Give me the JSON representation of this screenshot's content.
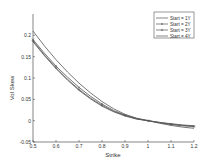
{
  "chart_data": {
    "type": "line",
    "title": "",
    "xlabel": "Strike",
    "ylabel": "Vol Skew",
    "xlim": [
      0.5,
      1.2
    ],
    "ylim": [
      -0.05,
      0.25
    ],
    "xticks": [
      "0.5",
      "0.6",
      "0.7",
      "0.8",
      "0.9",
      "1",
      "1.1",
      "1.2"
    ],
    "yticks": [
      "-0.05",
      "0",
      "0.05",
      "0.1",
      "0.15",
      "0.2"
    ],
    "grid": false,
    "legend_position": "upper right",
    "x": [
      0.5,
      0.55,
      0.6,
      0.65,
      0.7,
      0.75,
      0.8,
      0.85,
      0.9,
      0.95,
      1.0,
      1.05,
      1.1,
      1.15,
      1.2
    ],
    "series": [
      {
        "name": "Start = 1Y",
        "marker": "none",
        "values": [
          0.21,
          0.175,
          0.143,
          0.114,
          0.088,
          0.065,
          0.045,
          0.028,
          0.015,
          0.006,
          0.0,
          -0.006,
          -0.011,
          -0.015,
          -0.018
        ]
      },
      {
        "name": "Start = 2Y",
        "marker": "x",
        "values": [
          0.19,
          0.158,
          0.128,
          0.102,
          0.078,
          0.057,
          0.039,
          0.024,
          0.013,
          0.005,
          0.0,
          -0.005,
          -0.009,
          -0.012,
          -0.014
        ]
      },
      {
        "name": "Start = 3Y",
        "marker": "+",
        "values": [
          0.187,
          0.154,
          0.124,
          0.097,
          0.073,
          0.053,
          0.036,
          0.022,
          0.012,
          0.004,
          0.0,
          -0.004,
          -0.008,
          -0.011,
          -0.013
        ]
      },
      {
        "name": "Start = 4Y",
        "marker": "none",
        "values": [
          0.185,
          0.152,
          0.122,
          0.095,
          0.071,
          0.051,
          0.034,
          0.021,
          0.011,
          0.004,
          0.0,
          -0.004,
          -0.007,
          -0.01,
          -0.012
        ]
      }
    ]
  },
  "legend": {
    "items": [
      "Start = 1Y",
      "Start = 2Y",
      "Start = 3Y",
      "Start = 4Y"
    ]
  },
  "colors": {
    "line": "#555555",
    "axis": "#333333"
  }
}
